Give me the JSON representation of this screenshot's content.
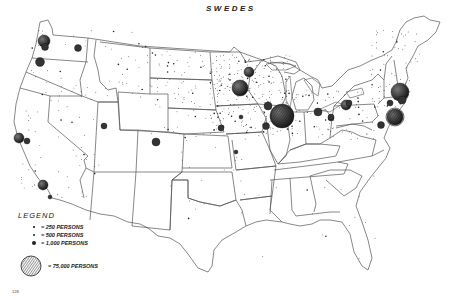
{
  "title": "SWEDES",
  "legend": {
    "title": "LEGEND",
    "items": [
      {
        "label": "= 250 PERSONS",
        "size": 1.5
      },
      {
        "label": "= 500 PERSONS",
        "size": 2.5
      },
      {
        "label": "= 1,000 PERSONS",
        "size": 4
      },
      {
        "label": "= 75,000 PERSONS",
        "size": 28
      }
    ]
  },
  "page_number": "128",
  "colors": {
    "ink": "#222222",
    "background": "#ffffff",
    "border": "#555555"
  },
  "clusters": [
    {
      "name": "Seattle",
      "x": 44,
      "y": 41,
      "r": 6
    },
    {
      "name": "Tacoma",
      "x": 45,
      "y": 47,
      "r": 3.5
    },
    {
      "name": "Spokane",
      "x": 78,
      "y": 48,
      "r": 3.5
    },
    {
      "name": "Portland",
      "x": 40,
      "y": 62,
      "r": 4.5
    },
    {
      "name": "San Francisco",
      "x": 19,
      "y": 138,
      "r": 5
    },
    {
      "name": "Oakland",
      "x": 27,
      "y": 141,
      "r": 3
    },
    {
      "name": "Los Angeles",
      "x": 43,
      "y": 185,
      "r": 5
    },
    {
      "name": "San Diego",
      "x": 50,
      "y": 197,
      "r": 2
    },
    {
      "name": "Salt Lake City",
      "x": 104,
      "y": 126,
      "r": 3
    },
    {
      "name": "Denver",
      "x": 156,
      "y": 142,
      "r": 4
    },
    {
      "name": "Duluth",
      "x": 249,
      "y": 72,
      "r": 5
    },
    {
      "name": "Minneapolis-St. Paul",
      "x": 240,
      "y": 88,
      "r": 8
    },
    {
      "name": "Sioux City",
      "x": 222,
      "y": 127,
      "r": 2
    },
    {
      "name": "Omaha",
      "x": 221,
      "y": 128,
      "r": 3
    },
    {
      "name": "Des Moines",
      "x": 241,
      "y": 117,
      "r": 2
    },
    {
      "name": "Kansas City",
      "x": 236,
      "y": 152,
      "r": 2
    },
    {
      "name": "Chicago",
      "x": 282,
      "y": 116,
      "r": 12
    },
    {
      "name": "Rockford",
      "x": 268,
      "y": 106,
      "r": 4
    },
    {
      "name": "Moline",
      "x": 266,
      "y": 126,
      "r": 3.5
    },
    {
      "name": "Detroit",
      "x": 318,
      "y": 112,
      "r": 4
    },
    {
      "name": "Cleveland",
      "x": 331,
      "y": 118,
      "r": 3
    },
    {
      "name": "Jamestown",
      "x": 346,
      "y": 105,
      "r": 5
    },
    {
      "name": "Pittsburgh",
      "x": 331,
      "y": 117,
      "r": 3
    },
    {
      "name": "Buffalo",
      "x": 349,
      "y": 103,
      "r": 3
    },
    {
      "name": "Boston/Worcester",
      "x": 400,
      "y": 92,
      "r": 9
    },
    {
      "name": "Providence",
      "x": 402,
      "y": 100,
      "r": 4
    },
    {
      "name": "Hartford",
      "x": 390,
      "y": 103,
      "r": 3
    },
    {
      "name": "New York",
      "x": 395,
      "y": 117,
      "r": 8
    },
    {
      "name": "Philadelphia",
      "x": 381,
      "y": 125,
      "r": 3.5
    }
  ]
}
